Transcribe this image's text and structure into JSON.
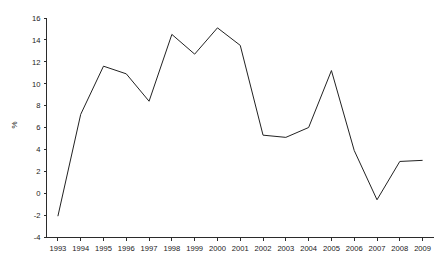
{
  "chart_data": {
    "type": "line",
    "title": "",
    "subtitle": "",
    "xlabel": "",
    "ylabel": "%",
    "categories": [
      "1993",
      "1994",
      "1995",
      "1996",
      "1997",
      "1998",
      "1999",
      "2000",
      "2001",
      "2002",
      "2003",
      "2004",
      "2005",
      "2006",
      "2007",
      "2008",
      "2009"
    ],
    "values": [
      -2.1,
      7.2,
      11.6,
      10.9,
      8.4,
      14.5,
      12.7,
      15.1,
      13.5,
      5.3,
      5.1,
      6.0,
      11.2,
      3.9,
      -0.6,
      2.9,
      3.0
    ],
    "series": [
      {
        "name": "",
        "values": [
          -2.1,
          7.2,
          11.6,
          10.9,
          8.4,
          14.5,
          12.7,
          15.1,
          13.5,
          5.3,
          5.1,
          6.0,
          11.2,
          3.9,
          -0.6,
          2.9,
          3.0
        ]
      }
    ],
    "ylim": [
      -4,
      16
    ],
    "xlim": [
      "1993",
      "2009"
    ],
    "y_ticks": [
      -4,
      -2,
      0,
      2,
      4,
      6,
      8,
      10,
      12,
      14,
      16
    ],
    "y_tick_labels": [
      "-4",
      "-2",
      "0",
      "2",
      "4",
      "6",
      "8",
      "10",
      "12",
      "14",
      "16"
    ],
    "x_ticks": [
      "1993",
      "1994",
      "1995",
      "1996",
      "1997",
      "1998",
      "1999",
      "2000",
      "2001",
      "2002",
      "2003",
      "2004",
      "2005",
      "2006",
      "2007",
      "2008",
      "2009"
    ],
    "grid": false,
    "legend": false,
    "legend_position": "none",
    "line_color": "#222222",
    "axis_color": "#2b2b2b",
    "background_color": "#ffffff",
    "annotations": []
  }
}
